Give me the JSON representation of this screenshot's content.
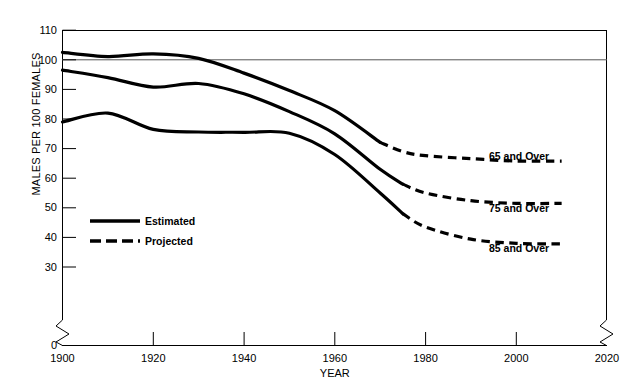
{
  "chart_data": {
    "type": "line",
    "title": "",
    "xlabel": "YEAR",
    "ylabel": "MALES PER 100 FEMALES",
    "xlim": [
      1900,
      2020
    ],
    "ylim": [
      0,
      110
    ],
    "y_break_between": [
      0,
      30
    ],
    "grid": false,
    "reference_lines": [
      100
    ],
    "xticks": [
      1900,
      1920,
      1940,
      1960,
      1980,
      2000,
      2020
    ],
    "xtick_labels": [
      "1900",
      "1920",
      "1940",
      "1960",
      "1980",
      "2000",
      "2020"
    ],
    "yticks": [
      0,
      30,
      40,
      50,
      60,
      70,
      80,
      90,
      100,
      110
    ],
    "ytick_labels": [
      "0",
      "30",
      "40",
      "50",
      "60",
      "70",
      "80",
      "90",
      "100",
      "110"
    ],
    "legend_position": "inner-left",
    "legend": [
      {
        "label": "Estimated",
        "style": "solid"
      },
      {
        "label": "Projected",
        "style": "dashed"
      }
    ],
    "series": [
      {
        "name": "65 and Over",
        "label": "65 and Over",
        "estimated_x": [
          1900,
          1910,
          1920,
          1930,
          1940,
          1950,
          1960,
          1970
        ],
        "estimated_values": [
          102.5,
          101.1,
          102.0,
          100.5,
          95.5,
          89.6,
          82.8,
          72.1
        ],
        "projected_x": [
          1970,
          1975,
          1980,
          1990,
          2000,
          2010
        ],
        "projected_values": [
          72.1,
          69.0,
          67.6,
          66.6,
          65.8,
          65.8
        ]
      },
      {
        "name": "75 and Over",
        "label": "75 and Over",
        "estimated_x": [
          1900,
          1910,
          1920,
          1930,
          1940,
          1950,
          1960,
          1970,
          1975
        ],
        "estimated_values": [
          96.5,
          94.0,
          90.8,
          92.0,
          88.5,
          82.5,
          75.0,
          63.0,
          58.0
        ],
        "projected_x": [
          1975,
          1980,
          1990,
          2000,
          2010
        ],
        "projected_values": [
          58.0,
          55.0,
          52.4,
          51.5,
          51.5
        ]
      },
      {
        "name": "85 and Over",
        "label": "85 and Over",
        "estimated_x": [
          1900,
          1910,
          1920,
          1930,
          1940,
          1950,
          1960,
          1970,
          1975
        ],
        "estimated_values": [
          79.0,
          82.0,
          76.5,
          75.6,
          75.5,
          75.2,
          68.0,
          55.0,
          48.0
        ],
        "projected_x": [
          1975,
          1980,
          1990,
          2000,
          2010
        ],
        "projected_values": [
          48.0,
          43.5,
          39.4,
          38.0,
          37.8
        ]
      }
    ],
    "colors": {
      "line": "#000000",
      "axis": "#000000",
      "reference_line": "#555555",
      "background": "#ffffff"
    }
  },
  "axis": {
    "y_title": "MALES PER 100 FEMALES",
    "x_title": "YEAR"
  },
  "legend": {
    "estimated_label": "Estimated",
    "projected_label": "Projected"
  },
  "annotations": {
    "series_65": "65 and Over",
    "series_75": "75 and Over",
    "series_85": "85 and Over"
  }
}
